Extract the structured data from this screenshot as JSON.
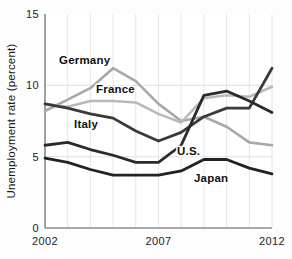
{
  "chart_data": {
    "type": "line",
    "title": "",
    "xlabel": "",
    "ylabel": "Unemployment rate (percent)",
    "xlim": [
      2002,
      2012
    ],
    "ylim": [
      0,
      15
    ],
    "x": [
      2002,
      2003,
      2004,
      2005,
      2006,
      2007,
      2008,
      2009,
      2010,
      2011,
      2012
    ],
    "yticks": [
      "0",
      "5",
      "10",
      "15"
    ],
    "ytick_values": [
      0,
      5,
      10,
      15
    ],
    "xticks": [
      "2002",
      "2007",
      "2012"
    ],
    "xtick_values": [
      2002,
      2007,
      2012
    ],
    "grid": true,
    "legend": "inline-labels",
    "series": [
      {
        "name": "Germany",
        "color": "#a8a8a8",
        "values": [
          8.2,
          9.0,
          9.8,
          11.2,
          10.3,
          8.7,
          7.5,
          7.8,
          7.1,
          6.0,
          5.8
        ]
      },
      {
        "name": "France",
        "color": "#b9b9b9",
        "values": [
          8.7,
          8.5,
          8.9,
          8.9,
          8.8,
          8.0,
          7.4,
          9.1,
          9.3,
          9.2,
          9.9
        ]
      },
      {
        "name": "Italy",
        "color": "#3a3a3a",
        "values": [
          8.7,
          8.4,
          8.0,
          7.7,
          6.8,
          6.1,
          6.7,
          7.8,
          8.4,
          8.4,
          11.2
        ]
      },
      {
        "name": "U.S.",
        "color": "#2a2a2a",
        "values": [
          5.8,
          6.0,
          5.5,
          5.1,
          4.6,
          4.6,
          5.8,
          9.3,
          9.6,
          8.9,
          8.1
        ]
      },
      {
        "name": "Japan",
        "color": "#222222",
        "values": [
          4.9,
          4.6,
          4.1,
          3.7,
          3.7,
          3.7,
          4.0,
          4.8,
          4.8,
          4.2,
          3.8
        ]
      }
    ],
    "annotations": [
      {
        "label": "Germany",
        "x_px": 59,
        "y_px": 64
      },
      {
        "label": "France",
        "x_px": 96,
        "y_px": 93
      },
      {
        "label": "Italy",
        "x_px": 74,
        "y_px": 128
      },
      {
        "label": "U.S.",
        "x_px": 177,
        "y_px": 155
      },
      {
        "label": "Japan",
        "x_px": 194,
        "y_px": 182
      }
    ]
  }
}
